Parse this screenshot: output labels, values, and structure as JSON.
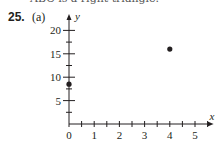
{
  "header": {
    "cut_text": "ABC is a right triangle.",
    "problem_number": "25.",
    "part_label": "(a)"
  },
  "chart_data": {
    "type": "scatter",
    "title": "",
    "xlabel": "x",
    "ylabel": "y",
    "xlim": [
      0,
      5.5
    ],
    "ylim": [
      0,
      22
    ],
    "x_ticks": [
      0,
      1,
      2,
      3,
      4,
      5
    ],
    "x_tick_labels": [
      "0",
      "1",
      "2",
      "3",
      "4",
      "5"
    ],
    "x_minor_step": 0.5,
    "y_ticks": [
      5,
      10,
      15,
      20
    ],
    "y_tick_labels": [
      "5",
      "10",
      "15",
      "20"
    ],
    "y_minor_step": 2.5,
    "grid": false,
    "series": [
      {
        "name": "points",
        "x": [
          0,
          4
        ],
        "y": [
          8.5,
          16
        ]
      }
    ]
  }
}
